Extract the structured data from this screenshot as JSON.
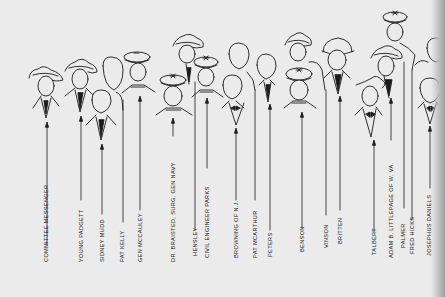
{
  "figure": {
    "type": "identification-key",
    "colors": {
      "paper": "#ebebeb",
      "ink": "#1b1b1b"
    }
  },
  "people": [
    {
      "id": 1,
      "label": "Committee Messenger",
      "line_x": 47,
      "head": "fedora",
      "row": "front"
    },
    {
      "id": 2,
      "label": "Young Padgett",
      "line_x": 81,
      "head": "fedora",
      "row": "front"
    },
    {
      "id": 3,
      "label": "Sidney Mudd",
      "line_x": 102,
      "head": "bare",
      "row": "front"
    },
    {
      "id": 4,
      "label": "Pat Kelly",
      "line_x": 123,
      "head": "bare",
      "row": "back"
    },
    {
      "id": 5,
      "label": "Gen McCauley",
      "line_x": 140,
      "head": "military",
      "row": "back"
    },
    {
      "id": 6,
      "label": "Dr. Braisted, Surg. Gen Navy",
      "line_x": 173,
      "head": "military",
      "row": "front"
    },
    {
      "id": 7,
      "label": "Hensley",
      "line_x": 195,
      "head": "fedora",
      "row": "back"
    },
    {
      "id": 8,
      "label": "Civil Engineer Parks",
      "line_x": 207,
      "head": "military",
      "row": "back"
    },
    {
      "id": 9,
      "label": "Browning of N.J.",
      "line_x": 236,
      "head": "bare",
      "row": "front"
    },
    {
      "id": 10,
      "label": "Pat McArthur",
      "line_x": 255,
      "head": "bare",
      "row": "back"
    },
    {
      "id": 11,
      "label": "Peters",
      "line_x": 270,
      "head": "bare",
      "row": "front"
    },
    {
      "id": 12,
      "label": "Benson",
      "line_x": 302,
      "head": "military",
      "row": "front"
    },
    {
      "id": 13,
      "label": "Vinson",
      "line_x": 326,
      "head": "fedora",
      "row": "back"
    },
    {
      "id": 14,
      "label": "Britten",
      "line_x": 340,
      "head": "bowler",
      "row": "back"
    },
    {
      "id": 15,
      "label": "Talbert",
      "line_x": 374,
      "head": "fedora",
      "row": "front"
    },
    {
      "id": 16,
      "label": "Adam B. Littlepage of W. Va.",
      "line_x": 391,
      "head": "fedora",
      "row": "back"
    },
    {
      "id": 17,
      "label": "Palmer",
      "line_x": 404,
      "head": "military",
      "row": "top"
    },
    {
      "id": 18,
      "label": "Fred Hicks",
      "line_x": 413,
      "head": "bare",
      "row": "back"
    },
    {
      "id": 19,
      "label": "Josephus Daniels",
      "line_x": 430,
      "head": "bare",
      "row": "front"
    }
  ]
}
